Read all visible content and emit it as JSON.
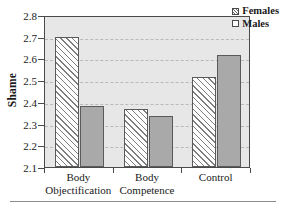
{
  "chart_data": {
    "type": "bar",
    "title": "",
    "xlabel": "",
    "ylabel": "Shame",
    "ylim": [
      2.1,
      2.8
    ],
    "ytick_step": 0.1,
    "yticks": [
      "2.8",
      "2.7",
      "2.6",
      "2.5",
      "2.4",
      "2.3",
      "2.2",
      "2.1"
    ],
    "grid": "horizontal-dashed",
    "legend_position": "top-right",
    "categories": [
      "Body Objectification",
      "Body Competence",
      "Control"
    ],
    "category_lines": [
      {
        "line1": "Body",
        "line2": "Objectification"
      },
      {
        "line1": "Body",
        "line2": "Competence"
      },
      {
        "line1": "Control",
        "line2": ""
      }
    ],
    "series": [
      {
        "name": "Females",
        "values": [
          2.7,
          2.365,
          2.515
        ],
        "fill": "diagonal-hatch",
        "color": "#fdfdfd"
      },
      {
        "name": "Males",
        "values": [
          2.38,
          2.333,
          2.615
        ],
        "fill": "solid",
        "color": "#a9a9a9"
      }
    ]
  },
  "legend": {
    "items": [
      {
        "label": "Females",
        "swatch": "hatched-swatch-icon"
      },
      {
        "label": "Males",
        "swatch": "plain-swatch-icon"
      }
    ]
  }
}
